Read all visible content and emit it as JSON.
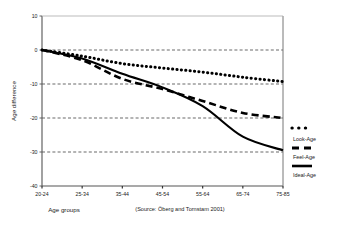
{
  "figure": {
    "cropped_heading": "",
    "caption": "(Source: Öberg and Tornstam 2001)"
  },
  "chart_data": {
    "type": "line",
    "title": "",
    "xlabel": "Age groups",
    "ylabel": "Age difference",
    "categories": [
      "20-24",
      "25-34",
      "35-44",
      "45-54",
      "55-64",
      "65-74",
      "75-85"
    ],
    "ylim": [
      -40,
      10
    ],
    "yticks": [
      10,
      0,
      -10,
      -20,
      -30,
      -40
    ],
    "ytick_labels": [
      "10",
      "0",
      "-10",
      "-20",
      "-30",
      "-40"
    ],
    "grid": true,
    "grid_style": "dashed-horizontal",
    "legend_position": "right",
    "series": [
      {
        "name": "Look-Age",
        "style": "dotted",
        "color": "#000000",
        "values": [
          0,
          -1.8,
          -4.0,
          -5.3,
          -6.5,
          -8.0,
          -9.3
        ]
      },
      {
        "name": "Feel-Age",
        "style": "dashed",
        "color": "#000000",
        "values": [
          0,
          -3.0,
          -8.5,
          -11.5,
          -15.0,
          -18.5,
          -20.0
        ]
      },
      {
        "name": "Ideal-Age",
        "style": "solid",
        "color": "#000000",
        "values": [
          0,
          -2.5,
          -7.0,
          -11.0,
          -16.5,
          -25.5,
          -29.5
        ]
      }
    ]
  }
}
